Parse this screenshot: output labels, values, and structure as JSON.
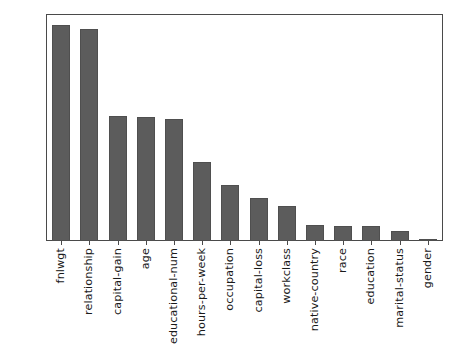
{
  "chart_data": {
    "type": "bar",
    "title": "",
    "xlabel": "",
    "ylabel": "",
    "grid": false,
    "legend": false,
    "ylim": [
      0.0,
      0.2125
    ],
    "ytick_labels": [
      "0.200",
      "0.175",
      "0.150",
      "0.125",
      "0.100",
      "0.075",
      "0.050",
      "0.025",
      "0.000"
    ],
    "ytick_values": [
      0.2,
      0.175,
      0.15,
      0.125,
      0.1,
      0.075,
      0.05,
      0.025,
      0.0
    ],
    "categories": [
      "fnlwgt",
      "relationship",
      "capital-gain",
      "age",
      "educational-num",
      "hours-per-week",
      "occupation",
      "capital-loss",
      "workclass",
      "native-country",
      "race",
      "education",
      "marital-status",
      "gender"
    ],
    "values": [
      0.2035,
      0.1995,
      0.1175,
      0.1165,
      0.1145,
      0.0745,
      0.053,
      0.04,
      0.033,
      0.0155,
      0.0145,
      0.0145,
      0.009,
      0.002
    ],
    "bar_color": "#5c5c5c",
    "bar_edge_color": "#4f4f4f",
    "axis_color": "#4a4a4a",
    "background_color": "#ffffff"
  }
}
